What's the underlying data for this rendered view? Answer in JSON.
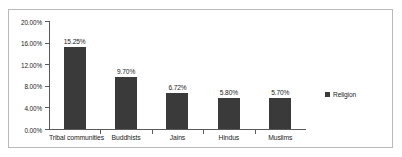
{
  "chart_data": {
    "type": "bar",
    "title": "",
    "subtitle": "",
    "xlabel": "",
    "ylabel": "",
    "categories": [
      "Tribal communities",
      "Buddhists",
      "Jains",
      "Hindus",
      "Muslims"
    ],
    "series": [
      {
        "name": "Religion",
        "values": [
          15.25,
          9.7,
          6.72,
          5.8,
          5.7
        ],
        "data_labels": [
          "15.25%",
          "9.70%",
          "6.72%",
          "5.80%",
          "5.70%"
        ],
        "color": "#3a3a3a"
      }
    ],
    "ylim": [
      0,
      20
    ],
    "ytick_values": [
      20,
      16,
      12,
      8,
      4,
      0
    ],
    "ytick_labels": [
      "20.00%",
      "16.00%",
      "12.00%",
      "8.00%",
      "4.00%",
      "0.00%"
    ],
    "grid": false,
    "legend": {
      "position": "right",
      "entries": [
        {
          "label": "Religion",
          "color": "#3a3a3a",
          "marker": "square-marker"
        }
      ]
    },
    "axis_color": "#5a5a5a",
    "text_color": "#1c1c1c",
    "border_color": "#b9b9b9",
    "background_color": "#ffffff"
  }
}
